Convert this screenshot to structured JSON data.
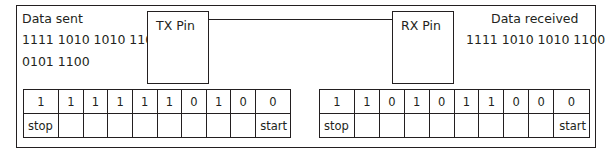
{
  "tx": {
    "heading": "Data sent",
    "line1": "1111 1010 1010 1100",
    "line2": "0101 1100",
    "pin_label": "TX Pin",
    "bits": [
      "1",
      "1",
      "1",
      "1",
      "1",
      "1",
      "0",
      "1",
      "0",
      "0"
    ],
    "markers": [
      "stop",
      "",
      "",
      "",
      "",
      "",
      "",
      "",
      "",
      "start"
    ]
  },
  "rx": {
    "heading": "Data received",
    "line1": "1111 1010 1010 1100",
    "pin_label": "RX Pin",
    "bits": [
      "1",
      "1",
      "0",
      "1",
      "0",
      "1",
      "1",
      "0",
      "0",
      "0"
    ],
    "markers": [
      "stop",
      "",
      "",
      "",
      "",
      "",
      "",
      "",
      "",
      "start"
    ]
  }
}
